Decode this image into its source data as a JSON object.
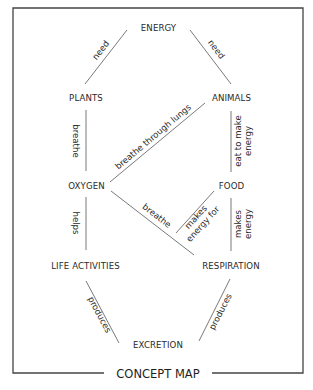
{
  "title": "CONCEPT MAP",
  "colors": {
    "text": "#2a2a2a",
    "lines": "#6a6a6a",
    "frame": "#444444",
    "background": "#ffffff"
  },
  "nodes": {
    "energy": "ENERGY",
    "plants": "PLANTS",
    "animals": "ANIMALS",
    "oxygen": "OXYGEN",
    "food": "FOOD",
    "life_activities": "LIFE ACTIVITIES",
    "respiration": "RESPIRATION",
    "excretion": "EXCRETION"
  },
  "links": {
    "plants_energy": "need",
    "animals_energy": "need",
    "plants_oxygen": "breathe",
    "animals_oxygen": "breathe through lungs",
    "animals_food_line1": "eat to make",
    "animals_food_line2": "energy",
    "oxygen_life": "helps",
    "oxygen_respiration": "breathe",
    "food_respiration_line1": "makes",
    "food_respiration_line2": "energy for",
    "respiration_food_line1": "makes",
    "respiration_food_line2": "energy",
    "life_excretion": "produces",
    "respiration_excretion": "produces"
  }
}
